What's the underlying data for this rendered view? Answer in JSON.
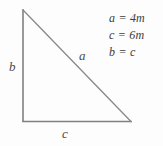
{
  "figure": {
    "type": "right-triangle-geometry-diagram",
    "background_color": "#fdfdfd",
    "stroke_color": "#808080",
    "text_color": "#3c3c3c"
  },
  "triangle": {
    "vertices": {
      "top": [
        23,
        10
      ],
      "bottom_left": [
        23,
        121
      ],
      "bottom_right": [
        131,
        122
      ]
    },
    "sides": {
      "vertical_leg_label": "b",
      "hypotenuse_label": "a",
      "horizontal_leg_label": "c"
    }
  },
  "labels": {
    "b": "b",
    "a": "a",
    "c": "c"
  },
  "equations": [
    "a = 4m",
    "c = 6m",
    "b = c"
  ]
}
